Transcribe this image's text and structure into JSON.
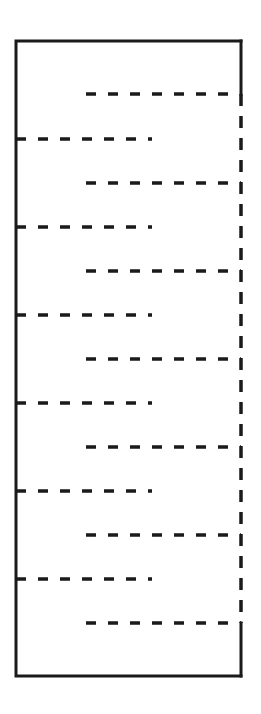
{
  "diagram": {
    "type": "serpentine-dashed-path-in-frame",
    "background": "#ffffff",
    "stroke_color": "#1a1a1a",
    "frame": {
      "left": 16,
      "top": 41,
      "right": 241,
      "bottom": 676
    },
    "right_solid_top": {
      "x": 241,
      "y1": 41,
      "y2": 94
    },
    "right_solid_bottom": {
      "x": 241,
      "y1": 623,
      "y2": 676
    },
    "right_dashed_vertical": {
      "x": 241,
      "y1": 94,
      "y2": 623
    },
    "right_rungs": [
      {
        "x1": 86,
        "x2": 241,
        "y": 94
      },
      {
        "x1": 86,
        "x2": 241,
        "y": 183
      },
      {
        "x1": 86,
        "x2": 241,
        "y": 271
      },
      {
        "x1": 86,
        "x2": 241,
        "y": 359
      },
      {
        "x1": 86,
        "x2": 241,
        "y": 447
      },
      {
        "x1": 86,
        "x2": 241,
        "y": 535
      },
      {
        "x1": 86,
        "x2": 241,
        "y": 623
      }
    ],
    "left_rungs": [
      {
        "x1": 16,
        "x2": 152,
        "y": 139
      },
      {
        "x1": 16,
        "x2": 152,
        "y": 227
      },
      {
        "x1": 16,
        "x2": 152,
        "y": 315
      },
      {
        "x1": 16,
        "x2": 152,
        "y": 403
      },
      {
        "x1": 16,
        "x2": 152,
        "y": 491
      },
      {
        "x1": 16,
        "x2": 152,
        "y": 579
      }
    ]
  }
}
